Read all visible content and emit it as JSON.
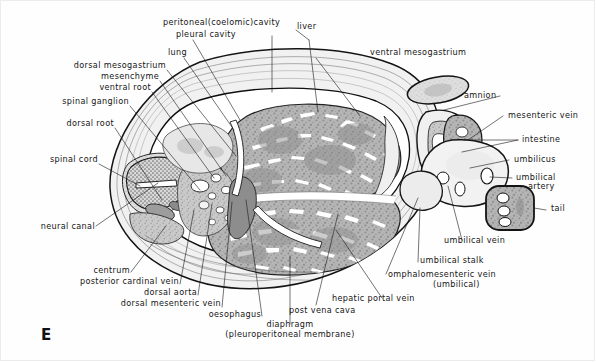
{
  "figure": {
    "panel_letter": "E"
  },
  "labels": {
    "peritoneal_cavity": "peritoneal(coelomic)cavity",
    "pleural_cavity": "pleural cavity",
    "liver": "liver",
    "lung": "lung",
    "ventral_mesogastrium": "ventral mesogastrium",
    "dorsal_mesogastrium": "dorsal mesogastrium",
    "mesenchyme": "mesenchyme",
    "ventral_root": "ventral root",
    "spinal_ganglion": "spinal ganglion",
    "dorsal_root": "dorsal root",
    "spinal_cord": "spinal cord",
    "neural_canal": "neural canal",
    "amnion": "amnion",
    "mesenteric_vein": "mesenteric vein",
    "intestine": "intestine",
    "umbilicus": "umbilicus",
    "umbilical_artery_line1": "umbilical",
    "umbilical_artery_line2": "artery",
    "tail": "tail",
    "umbilical_vein": "umbilical  vein",
    "umbilical_stalk": "umbilical stalk",
    "omphalomesenteric_vein_line1": "omphalomesenteric vein",
    "omphalomesenteric_vein_line2": "(umbilical)",
    "hepatic_portal_vein": "hepatic portal vein",
    "post_vena_cava": "post vena cava",
    "diaphragm_line1": "diaphragm",
    "diaphragm_line2": "(pleuroperitoneal membrane)",
    "oesophagus": "oesophagus",
    "dorsal_mesenteric_vein": "dorsal  mesenteric vein",
    "dorsal_aorta": "dorsal aorta",
    "posterior_cardinal_vein": "posterior  cardinal vein",
    "centrum": "centrum"
  },
  "colors": {
    "ink": "#151515",
    "leader": "#1d1d1d",
    "outline": "#141414",
    "tissue_mid": "#b9b9b9",
    "tissue_dark": "#9a9a9a",
    "tissue_light": "#e4e4e4",
    "background": "#ffffff",
    "frame": "#ececed"
  }
}
